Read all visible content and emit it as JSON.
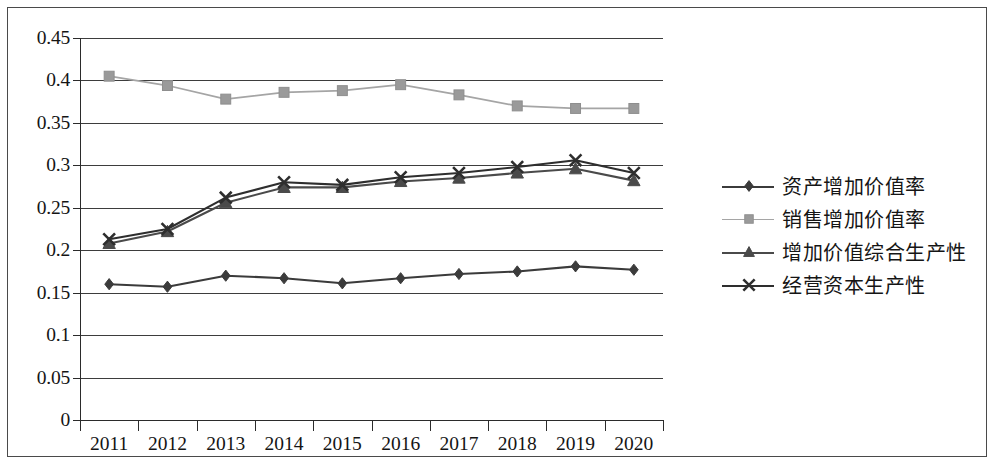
{
  "chart_data": {
    "type": "line",
    "title": "",
    "subtitle": "",
    "xlabel": "",
    "ylabel": "",
    "categories": [
      "2011",
      "2012",
      "2013",
      "2014",
      "2015",
      "2016",
      "2017",
      "2018",
      "2019",
      "2020"
    ],
    "ylim": [
      0,
      0.45
    ],
    "ytick_labels": [
      "0.45",
      "0.4",
      "0.35",
      "0.3",
      "0.25",
      "0.2",
      "0.15",
      "0.1",
      "0.05",
      "0"
    ],
    "ytick_values": [
      0.45,
      0.4,
      0.35,
      0.3,
      0.25,
      0.2,
      0.15,
      0.1,
      0.05,
      0
    ],
    "grid": true,
    "grid_axis": "y",
    "legend_position": "right",
    "series": [
      {
        "name": "资产增加价值率",
        "marker": "diamond",
        "color": "#3b3b3b",
        "line_color": "#3b3b3b",
        "values": [
          0.16,
          0.157,
          0.17,
          0.167,
          0.161,
          0.167,
          0.172,
          0.175,
          0.181,
          0.177
        ]
      },
      {
        "name": "销售增加价值率",
        "marker": "square",
        "color": "#9a9a9a",
        "line_color": "#a5a5a5",
        "values": [
          0.405,
          0.394,
          0.378,
          0.386,
          0.388,
          0.395,
          0.383,
          0.37,
          0.367,
          0.367
        ]
      },
      {
        "name": "增加价值综合生产性",
        "marker": "triangle",
        "color": "#4a4a4a",
        "line_color": "#4a4a4a",
        "values": [
          0.208,
          0.222,
          0.256,
          0.274,
          0.274,
          0.281,
          0.285,
          0.291,
          0.296,
          0.282
        ]
      },
      {
        "name": "经营资本生产性",
        "marker": "cross-x",
        "color": "#2e2e2e",
        "line_color": "#2e2e2e",
        "values": [
          0.213,
          0.225,
          0.262,
          0.28,
          0.277,
          0.286,
          0.291,
          0.298,
          0.306,
          0.291
        ]
      }
    ]
  }
}
